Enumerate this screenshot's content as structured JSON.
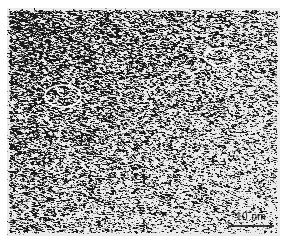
{
  "image": {
    "type": "TEM micrograph",
    "description": "High-resolution transmission electron micrograph showing amorphous/nanocrystalline speckle texture with two highlighted regions",
    "background": "#ffffff",
    "frame": {
      "x": 7,
      "y": 8,
      "width": 273,
      "height": 228
    }
  },
  "annotations": {
    "highlights": [
      {
        "name": "highlight-region-1",
        "cx": 63,
        "cy": 96,
        "rx": 18,
        "ry": 11,
        "stroke": "#ffffff"
      },
      {
        "name": "highlight-region-2",
        "cx": 220,
        "cy": 57,
        "rx": 15,
        "ry": 9,
        "stroke": "#ffffff"
      }
    ],
    "scale_bar": {
      "label": "10 nm",
      "x1": 228,
      "x2": 274,
      "y": 226,
      "color": "#000000"
    }
  }
}
